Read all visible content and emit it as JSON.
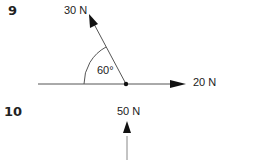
{
  "problems": [
    {
      "number": "9",
      "forces": [
        {
          "label": "30 N",
          "direction": "up-left"
        },
        {
          "label": "20 N",
          "direction": "right"
        }
      ],
      "angle_label": "60°"
    },
    {
      "number": "10",
      "forces": [
        {
          "label": "50 N",
          "direction": "up"
        }
      ]
    }
  ],
  "colors": {
    "line": "#555555",
    "text": "#222222"
  }
}
